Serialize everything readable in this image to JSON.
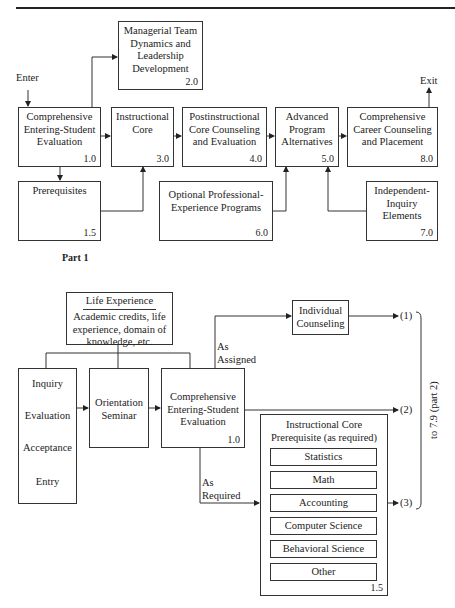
{
  "part1": {
    "caption": "Part 1",
    "enter_label": "Enter",
    "exit_label": "Exit",
    "boxes": {
      "b1_0": {
        "title": "Comprehensive Entering-Student Evaluation",
        "number": "1.0"
      },
      "b1_5": {
        "title": "Prerequisites",
        "number": "1.5"
      },
      "b2_0": {
        "title": "Managerial Team Dynamics and Leadership Development",
        "number": "2.0"
      },
      "b3_0": {
        "title": "Instructional Core",
        "number": "3.0"
      },
      "b4_0": {
        "title": "Postinstructional Core Counseling and Evaluation",
        "number": "4.0"
      },
      "b5_0": {
        "title": "Advanced Program Alternatives",
        "number": "5.0"
      },
      "b6_0": {
        "title": "Optional Professional-Experience Programs",
        "number": "6.0"
      },
      "b7_0": {
        "title": "Independent-Inquiry Elements",
        "number": "7.0"
      },
      "b8_0": {
        "title": "Comprehensive Career Counseling and Placement",
        "number": "8.0"
      }
    }
  },
  "part2": {
    "life_experience": {
      "heading": "Life Experience",
      "body": "Academic credits, life experience, domain of knowledge, etc."
    },
    "steps": [
      "Inquiry",
      "Evaluation",
      "Acceptance",
      "Entry"
    ],
    "orientation": {
      "title": "Orientation Seminar"
    },
    "evaluation": {
      "title": "Comprehensive Entering-Student Evaluation",
      "number": "1.0"
    },
    "individual_counseling": {
      "title": "Individual Counseling"
    },
    "as_assigned": "As Assigned",
    "as_required": "As Required",
    "prereq": {
      "title": "Instructional Core Prerequisite (as required)",
      "number": "1.5",
      "items": [
        "Statistics",
        "Math",
        "Accounting",
        "Computer Science",
        "Behavioral Science",
        "Other"
      ]
    },
    "outputs": [
      "(1)",
      "(2)",
      "(3)"
    ],
    "bracket_label": "to 7.9 (part 2)"
  }
}
